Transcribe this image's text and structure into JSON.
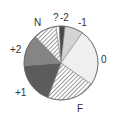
{
  "chart_data": {
    "type": "pie",
    "title": "",
    "start_angle_deg": 352,
    "direction": "clockwise",
    "slices": [
      {
        "label": "?",
        "value": 1.5,
        "fill": "#ffffff",
        "pattern": "none"
      },
      {
        "label": "-2",
        "value": 2.5,
        "fill": "#4a4a4a",
        "pattern": "none"
      },
      {
        "label": "-1",
        "value": 8,
        "fill": "#d4d4d4",
        "pattern": "none"
      },
      {
        "label": "0",
        "value": 25,
        "fill": "#efefef",
        "pattern": "none"
      },
      {
        "label": "F",
        "value": 21,
        "fill": "#ffffff",
        "pattern": "hatch"
      },
      {
        "label": "+1",
        "value": 18,
        "fill": "#5c5c5c",
        "pattern": "none"
      },
      {
        "label": "+2",
        "value": 14,
        "fill": "#858585",
        "pattern": "none"
      },
      {
        "label": "N",
        "value": 10,
        "fill": "#ffffff",
        "pattern": "hatch"
      }
    ],
    "legend": "none",
    "label_positions": [
      {
        "label": "?",
        "x": 53,
        "y": 13
      },
      {
        "label": "-2",
        "x": 60,
        "y": 13
      },
      {
        "label": "-1",
        "x": 78,
        "y": 18
      },
      {
        "label": "0",
        "x": 101,
        "y": 55
      },
      {
        "label": "F",
        "x": 77,
        "y": 104
      },
      {
        "label": "+1",
        "x": 15,
        "y": 88
      },
      {
        "label": "+2",
        "x": 10,
        "y": 45
      },
      {
        "label": "N",
        "x": 34,
        "y": 18
      }
    ]
  }
}
